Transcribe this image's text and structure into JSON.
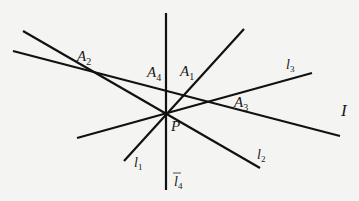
{
  "diagram": {
    "stroke_color": "#111111",
    "background": "#f4f4f2",
    "points": {
      "P": {
        "label": "P",
        "x": 166,
        "y": 114
      },
      "A1": {
        "label": "A",
        "sub": "1"
      },
      "A2": {
        "label": "A",
        "sub": "2"
      },
      "A3": {
        "label": "A",
        "sub": "3"
      },
      "A4": {
        "label": "A",
        "sub": "4"
      }
    },
    "lines": {
      "l1": {
        "label": "l",
        "sub": "1"
      },
      "l2": {
        "label": "l",
        "sub": "2"
      },
      "l3": {
        "label": "l",
        "sub": "3"
      },
      "l4": {
        "label": "l",
        "sub": "4"
      },
      "I": {
        "label": "I"
      }
    }
  }
}
